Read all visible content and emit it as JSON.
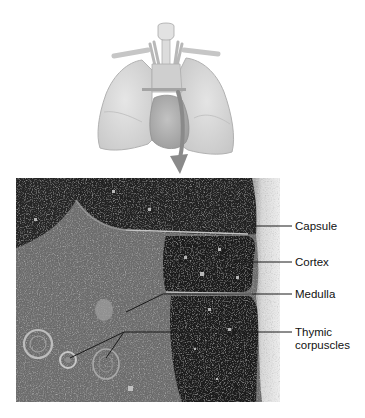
{
  "figure": {
    "locator_illustration": {
      "subject": "lungs-heart-thymus-locator",
      "arrow_color": "#8a8a8a"
    },
    "micrograph": {
      "subject": "thymus-histology-section"
    },
    "labels": [
      {
        "id": "capsule",
        "text": "Capsule"
      },
      {
        "id": "cortex",
        "text": "Cortex"
      },
      {
        "id": "medulla",
        "text": "Medulla"
      },
      {
        "id": "thymic-corpuscles",
        "text": "Thymic corpuscles"
      }
    ],
    "colors": {
      "background": "#ffffff",
      "illustration_fill": "#d9d9d9",
      "illustration_stroke": "#a8a8a8",
      "cortex_dark": "#1e1e1e",
      "medulla_mid": "#6d6d6d",
      "capsule_light": "#e4e4e4",
      "leader_line": "#222222",
      "label_text": "#111111"
    }
  }
}
